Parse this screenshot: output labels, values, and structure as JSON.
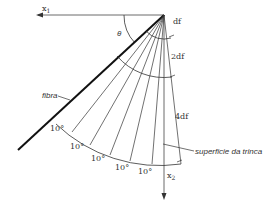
{
  "diagram": {
    "type": "fiber crack-surface angular segmentation",
    "labels": {
      "x1_axis": "x",
      "x1_sub": "1",
      "x2_axis": "x",
      "x2_sub": "2",
      "angle": "θ",
      "fiber": "fibra",
      "crack_surface": "superficie da trinca",
      "df": "df",
      "two_df": "2df",
      "four_df": "4df"
    },
    "angle_increment_labels": [
      "10°",
      "10°",
      "10°",
      "10°",
      "10°"
    ],
    "colors": {
      "line": "#333333",
      "fiber": "#111111",
      "background": "#ffffff"
    }
  }
}
